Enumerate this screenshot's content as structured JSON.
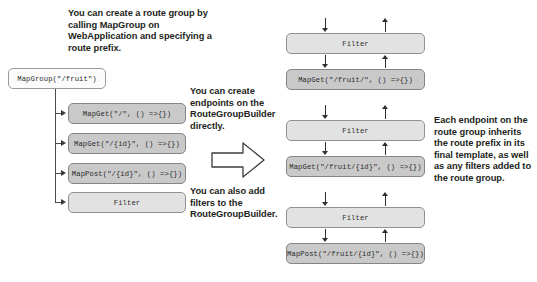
{
  "diagram": {
    "annotations": {
      "top": "You can create a route group by calling MapGroup on WebApplication and specifying a route prefix.",
      "endpoints": "You can create endpoints on the RouteGroupBuilder directly.",
      "filters": "You can also add filters to the RouteGroupBuilder.",
      "inherits": "Each endpoint on the route group inherits the route prefix in its final template, as well as any filters added to the route group."
    },
    "left_column": {
      "root_box": {
        "label": "MapGroup(\"/fruit\")",
        "kind": "route-group"
      },
      "children": [
        {
          "label": "MapGet(\"/\", () =>{})",
          "kind": "endpoint"
        },
        {
          "label": "MapGet(\"/{id}\", () =>{})",
          "kind": "endpoint"
        },
        {
          "label": "MapPost(\"/{id}\", () =>{})",
          "kind": "endpoint"
        },
        {
          "label": "Filter",
          "kind": "filter"
        }
      ]
    },
    "transform_arrow": {
      "icon": "block-arrow-right-icon",
      "direction": "right"
    },
    "right_column": {
      "groups": [
        {
          "filter": {
            "label": "Filter",
            "kind": "filter"
          },
          "endpoint": {
            "label": "MapGet(\"/fruit/\", () =>{})",
            "kind": "endpoint"
          }
        },
        {
          "filter": {
            "label": "Filter",
            "kind": "filter"
          },
          "endpoint": {
            "label": "MapGet(\"/fruit/{id}\", () =>{})",
            "kind": "endpoint"
          }
        },
        {
          "filter": {
            "label": "Filter",
            "kind": "filter"
          },
          "endpoint": {
            "label": "MapPost(\"/fruit/{id}\", () =>{})",
            "kind": "endpoint"
          }
        }
      ]
    },
    "colors": {
      "background": "#ffffff",
      "text": "#231f20",
      "box_white": "#fbfbfb",
      "box_filter": "#e2e2e2",
      "box_endpoint": "#c9c9c9",
      "box_border": "#8e8e8e",
      "connector": "#4a4a4a"
    }
  }
}
